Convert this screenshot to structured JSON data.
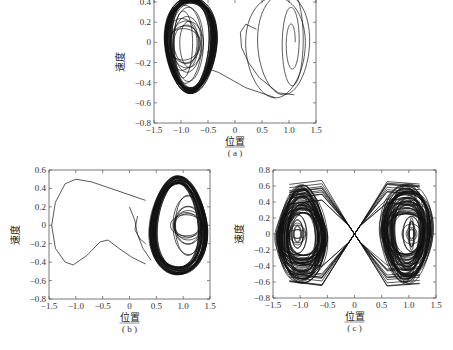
{
  "chart_data": [
    {
      "id": "a",
      "type": "line",
      "subtype": "phase-portrait",
      "caption": "(a)",
      "xlabel": "位置",
      "ylabel": "速度",
      "xlim": [
        -1.5,
        1.5
      ],
      "ylim": [
        -0.8,
        0.5
      ],
      "xticks": [
        "-1.5",
        "-1.0",
        "-0.5",
        "0",
        "0.5",
        "1.0",
        "1.5"
      ],
      "yticks": [
        "0.4",
        "0.2",
        "0",
        "-0.2",
        "-0.4",
        "-0.6",
        "-0.8"
      ],
      "grid": false,
      "description": "Trajectory starts near (1.0, 0) spiraling outward in right well (x 0.2–1.4, v -0.55–0.45), then crosses to left well and settles into dense limit-cycle orbit around x≈-1.0 (x -1.3 to -0.35, v -0.5 to 0.45)",
      "series": [
        {
          "name": "right-well transient",
          "center": [
            1.0,
            0.0
          ],
          "x_range": [
            0.2,
            1.4
          ],
          "y_range": [
            -0.55,
            0.45
          ]
        },
        {
          "name": "left-well attractor",
          "center": [
            -0.85,
            -0.05
          ],
          "x_range": [
            -1.3,
            -0.35
          ],
          "y_range": [
            -0.5,
            0.45
          ]
        }
      ]
    },
    {
      "id": "b",
      "type": "line",
      "subtype": "phase-portrait",
      "caption": "(b)",
      "xlabel": "位置",
      "ylabel": "速度",
      "xlim": [
        -1.5,
        1.5
      ],
      "ylim": [
        -0.8,
        0.6
      ],
      "xticks": [
        "-1.5",
        "-1.0",
        "-0.5",
        "0",
        "0.5",
        "1.0",
        "1.5"
      ],
      "yticks": [
        "0.6",
        "0.4",
        "0.2",
        "0",
        "-0.2",
        "-0.4",
        "-0.6",
        "-0.8"
      ],
      "grid": false,
      "description": "Single large excursion loop into left region (x to -1.45, v 0.5 to -0.43) then dense attractor in right well around x≈0.9 (x 0.3–1.4, v -0.55–0.55), inner spiral near (1.1, 0)",
      "series": [
        {
          "name": "left excursion",
          "x_range": [
            -1.45,
            0.4
          ],
          "y_range": [
            -0.43,
            0.5
          ]
        },
        {
          "name": "right-well attractor",
          "center": [
            0.9,
            0.0
          ],
          "x_range": [
            0.3,
            1.4
          ],
          "y_range": [
            -0.55,
            0.55
          ]
        }
      ]
    },
    {
      "id": "c",
      "type": "line",
      "subtype": "phase-portrait",
      "caption": "(c)",
      "xlabel": "位置",
      "ylabel": "速度",
      "xlim": [
        -1.5,
        1.5
      ],
      "ylim": [
        -0.8,
        0.8
      ],
      "xticks": [
        "-1.5",
        "-1.0",
        "-0.5",
        "0",
        "0.5",
        "1.0",
        "1.5"
      ],
      "yticks": [
        "0.8",
        "0.6",
        "0.4",
        "0.2",
        "0",
        "-0.2",
        "-0.4",
        "-0.6",
        "-0.8"
      ],
      "grid": false,
      "description": "Chaotic double-scroll attractor covering both wells (x -1.45–1.45, v -0.65–0.65), with dense orbits around x≈-1.0 and x≈1.0 crossing near origin",
      "series": [
        {
          "name": "left scroll",
          "center": [
            -1.0,
            0.0
          ],
          "x_range": [
            -1.45,
            -0.1
          ],
          "y_range": [
            -0.62,
            0.65
          ]
        },
        {
          "name": "right scroll",
          "center": [
            1.0,
            0.0
          ],
          "x_range": [
            0.1,
            1.45
          ],
          "y_range": [
            -0.65,
            0.6
          ]
        }
      ]
    }
  ],
  "panels": {
    "a": {
      "caption": "(a)",
      "xlabel": "位置",
      "ylabel": "速度"
    },
    "b": {
      "caption": "(b)",
      "xlabel": "位置",
      "ylabel": "速度"
    },
    "c": {
      "caption": "(c)",
      "xlabel": "位置",
      "ylabel": "速度"
    }
  }
}
